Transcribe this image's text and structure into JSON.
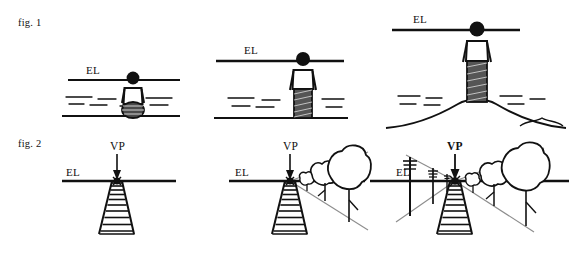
{
  "figure": {
    "width": 569,
    "height": 258,
    "background_color": "#ffffff",
    "ink_color": "#111111",
    "guide_color": "#8d8d8d",
    "title_font_style": "serif"
  },
  "captions": {
    "fig1": "fig. 1",
    "fig2": "fig. 2"
  },
  "labels": {
    "eye_level": "EL",
    "vanishing_point": "VP"
  },
  "row1": {
    "caption": "fig. 1",
    "description": "Eye level changes with the observer's height and position",
    "panels": [
      {
        "id": "fig1-panel-1",
        "pose": "seated",
        "el_label": "EL",
        "el_y": 80,
        "el_x_start": 68,
        "el_x_end": 180,
        "el_label_x": 86,
        "el_label_y": 74,
        "figure_x": 133,
        "ground_y": 115,
        "water_lines": 6,
        "terrain": "flat"
      },
      {
        "id": "fig1-panel-2",
        "pose": "standing",
        "el_label": "EL",
        "el_y": 61,
        "el_x_start": 216,
        "el_x_end": 340,
        "el_label_x": 244,
        "el_label_y": 54,
        "figure_x": 303,
        "ground_y": 118,
        "water_lines": 6,
        "terrain": "flat"
      },
      {
        "id": "fig1-panel-3",
        "pose": "standing-on-hill",
        "el_label": "EL",
        "el_y": 30,
        "el_x_start": 392,
        "el_x_end": 520,
        "el_label_x": 413,
        "el_label_y": 23,
        "figure_x": 477,
        "ground_y": 120,
        "water_lines": 6,
        "terrain": "hill"
      }
    ]
  },
  "row2": {
    "caption": "fig. 2",
    "description": "All receding parallel lines converge at the vanishing point on the eye level",
    "panels": [
      {
        "id": "fig2-panel-1",
        "el_label": "EL",
        "vp_label": "VP",
        "vp_label_bold": false,
        "el_y": 181,
        "el_x_start": 62,
        "el_x_end": 176,
        "el_label_x": 66,
        "el_label_y": 175,
        "vp_x": 117,
        "vp_y": 181,
        "vp_label_x": 117,
        "vp_label_y": 150,
        "elements": [
          "ladder"
        ],
        "ladder_rungs": 11,
        "guides": false
      },
      {
        "id": "fig2-panel-2",
        "el_label": "EL",
        "vp_label": "VP",
        "vp_label_bold": false,
        "el_y": 181,
        "el_x_start": 229,
        "el_x_end": 365,
        "el_label_x": 235,
        "el_label_y": 175,
        "vp_x": 290,
        "vp_y": 181,
        "vp_label_x": 290,
        "vp_label_y": 150,
        "elements": [
          "ladder",
          "trees",
          "guide-lines"
        ],
        "ladder_rungs": 11,
        "tree_count": 3,
        "guides": true
      },
      {
        "id": "fig2-panel-3",
        "el_label": "EL",
        "vp_label": "VP",
        "vp_label_bold": true,
        "el_y": 181,
        "el_x_start": 370,
        "el_x_end": 569,
        "el_label_x": 396,
        "el_label_y": 175,
        "vp_x": 455,
        "vp_y": 181,
        "vp_label_x": 455,
        "vp_label_y": 150,
        "elements": [
          "ladder",
          "trees",
          "telephone-poles",
          "guide-lines"
        ],
        "ladder_rungs": 11,
        "tree_count": 3,
        "pole_count": 3,
        "guides": true
      }
    ]
  }
}
